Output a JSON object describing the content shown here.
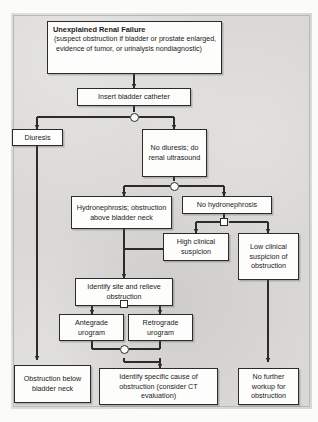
{
  "diagram": {
    "palette": {
      "panel_background": "#d9d8d6",
      "box_fill": "#fdfdfc",
      "box_border": "#2b2b2b",
      "connector": "#2b2b2b"
    },
    "nodes": [
      {
        "id": "start",
        "heading": "Unexplained Renal Failure",
        "detail": "(suspect obstruction if bladder or prostate enlarged, evidence of tumor, or urinalysis nondiagnostic)"
      },
      {
        "id": "catheter",
        "text": "Insert bladder catheter"
      },
      {
        "id": "diuresis",
        "text": "Diuresis"
      },
      {
        "id": "no_diuresis",
        "text": "No diuresis; do renal ultrasound"
      },
      {
        "id": "hydronephrosis",
        "text": "Hydronephrosis; obstruction above bladder neck"
      },
      {
        "id": "no_hydronephrosis",
        "text": "No hydronephrosis"
      },
      {
        "id": "high_suspicion",
        "text": "High clinical suspicion"
      },
      {
        "id": "low_suspicion",
        "text": "Low clinical suspicion of obstruction"
      },
      {
        "id": "identify_site",
        "text": "Identify site and relieve obstruction"
      },
      {
        "id": "antegrade",
        "text": "Antegrade urogram"
      },
      {
        "id": "retrograde",
        "text": "Retrograde urogram"
      },
      {
        "id": "obstruction_below",
        "text": "Obstruction below bladder neck"
      },
      {
        "id": "identify_cause",
        "text": "Identify specific cause of obstruction (consider CT evaluation)"
      },
      {
        "id": "no_workup",
        "text": "No further workup for obstruction"
      }
    ],
    "junctions": [
      {
        "id": "j-catheter",
        "shape": "circle"
      },
      {
        "id": "j-ultrasound",
        "shape": "circle"
      },
      {
        "id": "j-hydro-split",
        "shape": "square"
      },
      {
        "id": "j-urogram-split",
        "shape": "square"
      },
      {
        "id": "j-urogram-merge",
        "shape": "circle"
      }
    ]
  }
}
